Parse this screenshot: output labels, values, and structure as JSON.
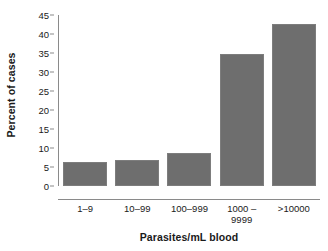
{
  "chart_data": {
    "type": "bar",
    "title": "",
    "xlabel": "Parasites/mL blood",
    "ylabel": "Percent of cases",
    "categories": [
      "1–9",
      "10–99",
      "100–999",
      "1000 –\n9999",
      ">10000"
    ],
    "values": [
      6.3,
      6.8,
      8.7,
      34.8,
      42.6
    ],
    "ylim": [
      0,
      45
    ],
    "ytick_labels": [
      "45",
      "40",
      "35",
      "30",
      "25",
      "20",
      "15",
      "10",
      "5",
      "0"
    ],
    "ytick_values": [
      45,
      40,
      35,
      30,
      25,
      20,
      15,
      10,
      5,
      0
    ],
    "grid": false,
    "legend": "none",
    "bar_color": "#6e6e6e",
    "axis_color": "#8a8a8a",
    "text_color": "#1a1a1a"
  },
  "xtick_lines": [
    [
      "1–9"
    ],
    [
      "10–99"
    ],
    [
      "100–999"
    ],
    [
      "1000 –",
      "9999"
    ],
    [
      ">10000"
    ]
  ]
}
